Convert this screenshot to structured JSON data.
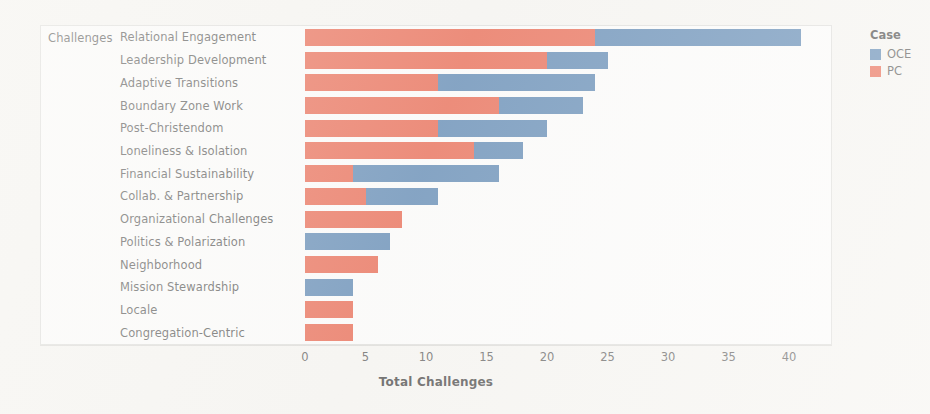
{
  "axis_group_label": "Challenges",
  "legend": {
    "title": "Case",
    "items": [
      {
        "label": "OCE",
        "color": "#4a7aac"
      },
      {
        "label": "PC",
        "color": "#e8563c"
      }
    ]
  },
  "chart_data": {
    "type": "bar",
    "orientation": "horizontal",
    "stacked": true,
    "title": "",
    "xlabel": "Total Challenges",
    "ylabel": "Challenges",
    "xlim": [
      0,
      42
    ],
    "xticks": [
      0,
      5,
      10,
      15,
      20,
      25,
      30,
      35,
      40
    ],
    "xticklabels": [
      "0",
      "5",
      "10",
      "15",
      "20",
      "25",
      "30",
      "35",
      "40"
    ],
    "grid": false,
    "legend_position": "right",
    "categories": [
      "Relational Engagement",
      "Leadership Development",
      "Adaptive Transitions",
      "Boundary Zone Work",
      "Post-Christendom",
      "Loneliness & Isolation",
      "Financial Sustainability",
      "Collab. & Partnership",
      "Organizational Challenges",
      "Politics & Polarization",
      "Neighborhood",
      "Mission Stewardship",
      "Locale",
      "Congregation-Centric"
    ],
    "series": [
      {
        "name": "PC",
        "color": "#e8563c",
        "values": [
          24,
          20,
          11,
          16,
          11,
          14,
          4,
          5,
          8,
          0,
          6,
          0,
          4,
          4
        ]
      },
      {
        "name": "OCE",
        "color": "#4a7aac",
        "values": [
          17,
          5,
          13,
          7,
          9,
          4,
          12,
          6,
          0,
          7,
          0,
          4,
          0,
          0
        ]
      }
    ],
    "totals": [
      41,
      25,
      24,
      23,
      20,
      18,
      16,
      11,
      8,
      7,
      6,
      4,
      4,
      4
    ]
  }
}
